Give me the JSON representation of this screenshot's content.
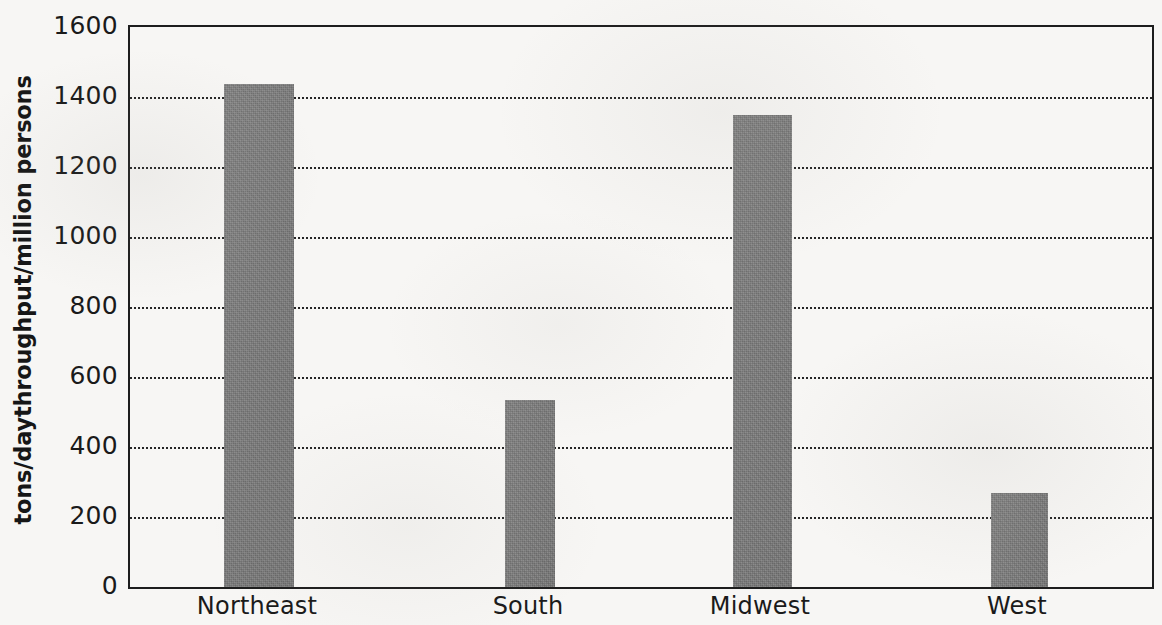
{
  "chart_data": {
    "type": "bar",
    "title": "",
    "xlabel": "",
    "ylabel": "tons/daythroughput/million persons",
    "categories": [
      "Northeast",
      "South",
      "Midwest",
      "West"
    ],
    "values": [
      1437,
      534,
      1349,
      269
    ],
    "ylim": [
      0,
      1600
    ],
    "ytick_labels": [
      "0",
      "200",
      "400",
      "600",
      "800",
      "1000",
      "1200",
      "1400",
      "1600"
    ],
    "ytick_values": [
      0,
      200,
      400,
      600,
      800,
      1000,
      1200,
      1400,
      1600
    ],
    "gridline_values": [
      200,
      400,
      600,
      800,
      1000,
      1200,
      1400
    ],
    "grid": true,
    "grid_style": "dotted",
    "legend": "none",
    "bar_color": "#7c7c7c",
    "axis_color": "#1d1d1d",
    "background_color": "#f7f6f4",
    "bar_geometry": [
      {
        "category": "Northeast",
        "left_px": 222,
        "width_px": 70
      },
      {
        "category": "South",
        "left_px": 503,
        "width_px": 50
      },
      {
        "category": "Midwest",
        "left_px": 731,
        "width_px": 59
      },
      {
        "category": "West",
        "left_px": 989,
        "width_px": 57
      }
    ],
    "category_label_x_px": [
      257,
      528,
      760,
      1017
    ]
  }
}
